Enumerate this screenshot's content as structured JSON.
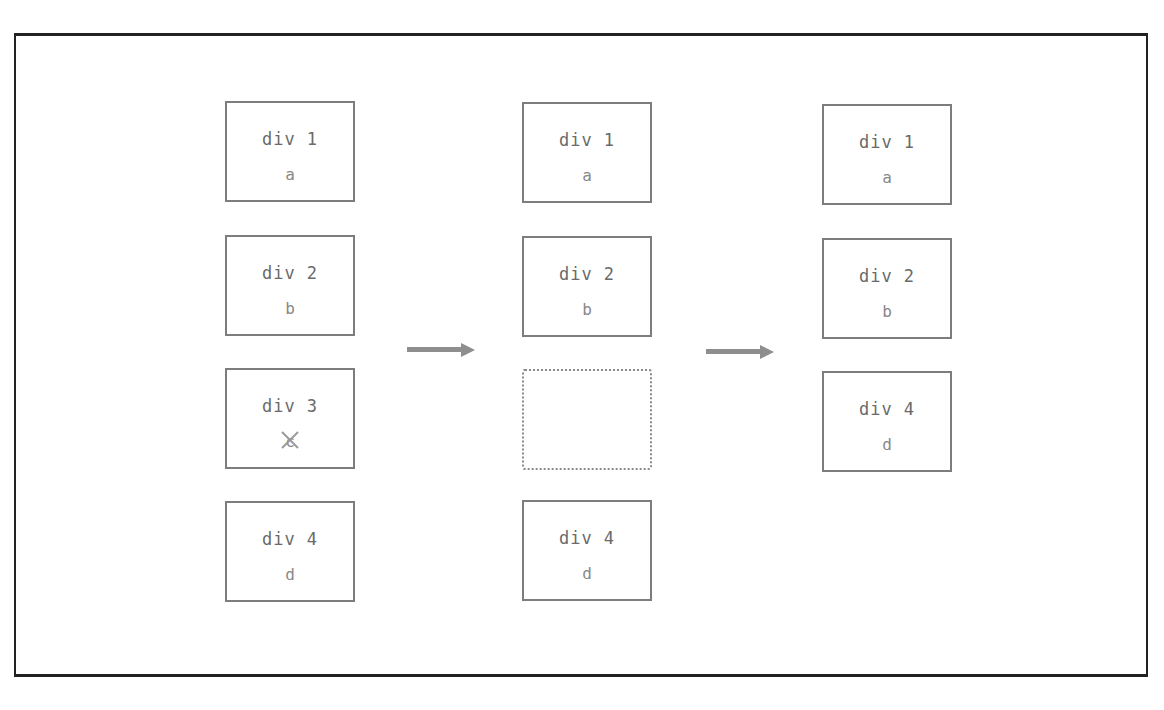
{
  "diagram": {
    "columns": [
      {
        "label": "before",
        "boxes": [
          {
            "title": "div 1",
            "value": "a"
          },
          {
            "title": "div 2",
            "value": "b"
          },
          {
            "title": "div 3",
            "value": "c",
            "removed": true
          },
          {
            "title": "div 4",
            "value": "d"
          }
        ]
      },
      {
        "label": "during",
        "boxes": [
          {
            "title": "div 1",
            "value": "a"
          },
          {
            "title": "div 2",
            "value": "b"
          },
          {
            "title": "",
            "value": "",
            "empty": true
          },
          {
            "title": "div 4",
            "value": "d"
          }
        ]
      },
      {
        "label": "after",
        "boxes": [
          {
            "title": "div 1",
            "value": "a"
          },
          {
            "title": "div 2",
            "value": "b"
          },
          {
            "title": "div 4",
            "value": "d"
          }
        ]
      }
    ],
    "arrows": [
      "arrow-right",
      "arrow-right"
    ],
    "colors": {
      "frame": "#222222",
      "box_border": "#7d7d7d",
      "arrow": "#8e8e8e",
      "text": "#6a6a6a",
      "remove_mark": "#999999"
    }
  }
}
